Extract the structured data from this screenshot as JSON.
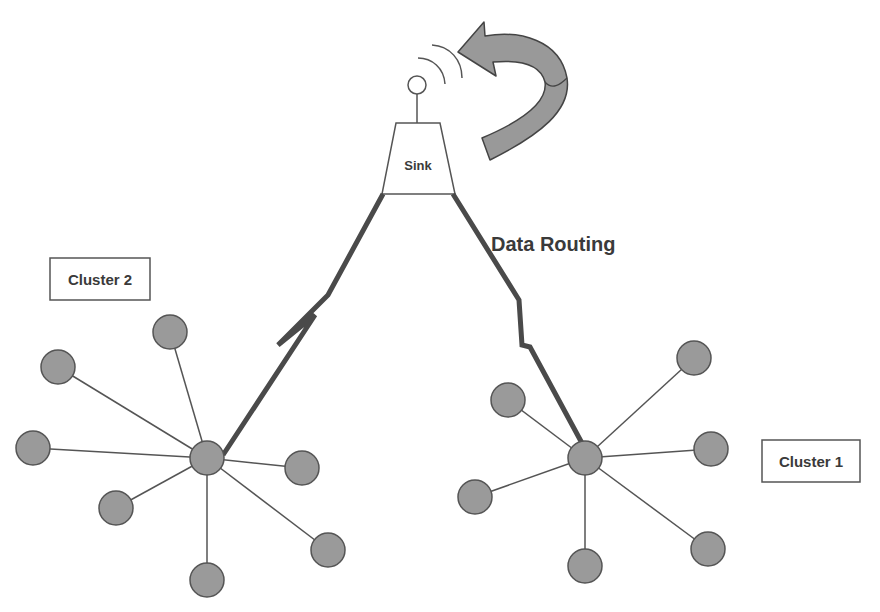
{
  "diagram": {
    "sink_label": "Sink",
    "routing_label": "Data Routing",
    "cluster1_label": "Cluster 1",
    "cluster2_label": "Cluster 2"
  },
  "colors": {
    "node_fill": "#9a9a9a",
    "node_stroke": "#555555",
    "link": "#555555",
    "routing_link": "#4a4a4a",
    "arrow_fill": "#999999",
    "text": "#3a3a3a"
  },
  "cluster2": {
    "head": {
      "x": 207,
      "y": 458
    },
    "members": [
      {
        "x": 170,
        "y": 332
      },
      {
        "x": 58,
        "y": 367
      },
      {
        "x": 33,
        "y": 448
      },
      {
        "x": 116,
        "y": 508
      },
      {
        "x": 302,
        "y": 468
      },
      {
        "x": 328,
        "y": 550
      },
      {
        "x": 207,
        "y": 580
      }
    ]
  },
  "cluster1": {
    "head": {
      "x": 585,
      "y": 458
    },
    "members": [
      {
        "x": 694,
        "y": 358
      },
      {
        "x": 508,
        "y": 400
      },
      {
        "x": 711,
        "y": 449
      },
      {
        "x": 475,
        "y": 497
      },
      {
        "x": 708,
        "y": 549
      },
      {
        "x": 585,
        "y": 566
      }
    ]
  }
}
